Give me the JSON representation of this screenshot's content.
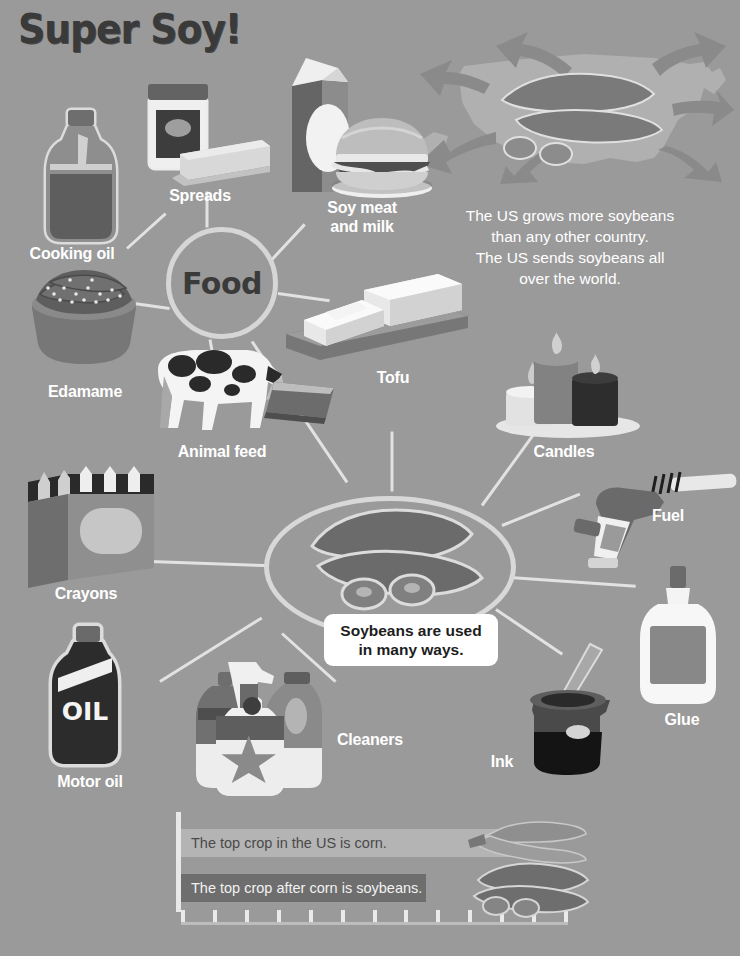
{
  "page": {
    "title": "Super Soy!",
    "background_color": "#9a9a9a",
    "label_color": "#ffffff"
  },
  "intro": {
    "text": "The US grows more soybeans\nthan any other country.\nThe US sends soybeans all\nover the world."
  },
  "hubs": {
    "food": {
      "label": "Food"
    },
    "soybeans": {
      "callout": "Soybeans are used\nin many ways."
    }
  },
  "food_items": [
    {
      "label": "Cooking oil",
      "icon": "oil-bottle-icon"
    },
    {
      "label": "Spreads",
      "icon": "jar-and-butter-icon"
    },
    {
      "label": "Soy meat\nand milk",
      "icon": "milk-carton-burger-icon"
    },
    {
      "label": "Tofu",
      "icon": "tofu-blocks-icon"
    },
    {
      "label": "Edamame",
      "icon": "edamame-bowl-icon"
    },
    {
      "label": "Animal feed",
      "icon": "cow-trough-icon"
    }
  ],
  "product_items": [
    {
      "label": "Candles",
      "icon": "candles-icon"
    },
    {
      "label": "Fuel",
      "icon": "fuel-nozzle-icon"
    },
    {
      "label": "Glue",
      "icon": "glue-bottle-icon"
    },
    {
      "label": "Ink",
      "icon": "ink-bottle-quill-icon"
    },
    {
      "label": "Cleaners",
      "icon": "cleaning-bottles-icon"
    },
    {
      "label": "Motor oil",
      "icon": "motor-oil-bottle-icon",
      "bottle_text": "OIL"
    },
    {
      "label": "Crayons",
      "icon": "crayon-box-icon"
    }
  ],
  "chart_data": {
    "type": "bar",
    "title": "",
    "orientation": "horizontal",
    "categories": [
      "Corn",
      "Soybeans"
    ],
    "values": [
      100,
      72
    ],
    "series": [
      {
        "name": "US crop size",
        "values": [
          100,
          72
        ]
      }
    ],
    "bar_labels": [
      "The top crop in the US is corn.",
      "The top crop after corn is soybeans."
    ],
    "bar_colors": [
      "#b4b4b4",
      "#6e6e6e"
    ],
    "bar_text_colors": [
      "#4a4a4a",
      "#f2f2f2"
    ],
    "xlabel": "",
    "ylabel": "",
    "grid": false,
    "axis_ticks": 13,
    "legend": "none",
    "decorations": [
      "corn-ear-icon",
      "soybean-pod-icon"
    ]
  }
}
